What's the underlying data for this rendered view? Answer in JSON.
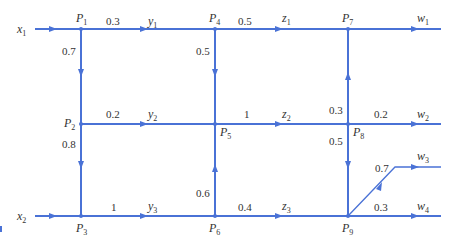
{
  "diagram": {
    "type": "flow-network",
    "color": "#4a72d6",
    "inputs": [
      {
        "id": "x1",
        "base": "x",
        "sub": "1",
        "to": "P1"
      },
      {
        "id": "x2",
        "base": "x",
        "sub": "2",
        "to": "P3"
      }
    ],
    "nodes": [
      {
        "id": "P1",
        "base": "P",
        "sub": "1"
      },
      {
        "id": "P2",
        "base": "P",
        "sub": "2"
      },
      {
        "id": "P3",
        "base": "P",
        "sub": "3"
      },
      {
        "id": "P4",
        "base": "P",
        "sub": "4"
      },
      {
        "id": "P5",
        "base": "P",
        "sub": "5"
      },
      {
        "id": "P6",
        "base": "P",
        "sub": "6"
      },
      {
        "id": "P7",
        "base": "P",
        "sub": "7"
      },
      {
        "id": "P8",
        "base": "P",
        "sub": "8"
      },
      {
        "id": "P9",
        "base": "P",
        "sub": "9"
      }
    ],
    "edges": [
      {
        "from": "P1",
        "to": "P4",
        "weight": "0.3",
        "flow": {
          "base": "y",
          "sub": "1"
        }
      },
      {
        "from": "P1",
        "to": "P2",
        "weight": "0.7"
      },
      {
        "from": "P2",
        "to": "P5",
        "weight": "0.2",
        "flow": {
          "base": "y",
          "sub": "2"
        }
      },
      {
        "from": "P2",
        "to": "P3",
        "weight": "0.8"
      },
      {
        "from": "P3",
        "to": "P6",
        "weight": "1",
        "flow": {
          "base": "y",
          "sub": "3"
        }
      },
      {
        "from": "P4",
        "to": "P7",
        "weight": "0.5",
        "flow": {
          "base": "z",
          "sub": "1"
        }
      },
      {
        "from": "P4",
        "to": "P5",
        "weight": "0.5"
      },
      {
        "from": "P5",
        "to": "P8",
        "weight": "1",
        "flow": {
          "base": "z",
          "sub": "2"
        }
      },
      {
        "from": "P6",
        "to": "P5",
        "weight": "0.6"
      },
      {
        "from": "P6",
        "to": "P9",
        "weight": "0.4",
        "flow": {
          "base": "z",
          "sub": "3"
        }
      },
      {
        "from": "P8",
        "to": "P7",
        "weight": "0.3"
      },
      {
        "from": "P8",
        "to": "P9",
        "weight": "0.5"
      }
    ],
    "outputs": [
      {
        "from": "P7",
        "weight": "",
        "base": "w",
        "sub": "1"
      },
      {
        "from": "P8",
        "weight": "0.2",
        "base": "w",
        "sub": "2"
      },
      {
        "from": "P9",
        "weight": "0.7",
        "base": "w",
        "sub": "3"
      },
      {
        "from": "P9",
        "weight": "0.3",
        "base": "w",
        "sub": "4"
      }
    ]
  }
}
